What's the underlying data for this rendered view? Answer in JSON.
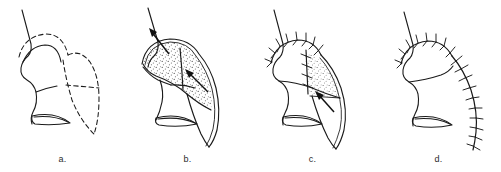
{
  "figure": {
    "background_color": "#ffffff",
    "ink_color": "#1a1a1a",
    "stipple_color": "#555555",
    "panel_count": 4,
    "view": "lateral nasal profile"
  },
  "panels": [
    {
      "id": "a",
      "label": "a.",
      "caption": "Flap design outlined with dashed incision lines on the nasal dorsum and sidewall",
      "stage": "design",
      "has_dashed_outline": true,
      "has_stipple": false,
      "has_arrows": false,
      "has_sutures": false,
      "arrow_count": 0,
      "suture_count": 0
    },
    {
      "id": "b",
      "label": "b.",
      "caption": "Flap elevated and rotated; stippled undersurface exposed with transposition arrows",
      "stage": "elevation",
      "has_dashed_outline": false,
      "has_stipple": true,
      "has_arrows": true,
      "has_sutures": false,
      "arrow_count": 2,
      "suture_count": 0
    },
    {
      "id": "c",
      "label": "c.",
      "caption": "Proximal closure sutured along the dorsum; distal flap still inset with advancement arrow",
      "stage": "inset",
      "has_dashed_outline": false,
      "has_stipple": true,
      "has_arrows": true,
      "has_sutures": true,
      "arrow_count": 1,
      "suture_count": 9
    },
    {
      "id": "d",
      "label": "d.",
      "caption": "Completed closure with continuous suture line along dorsum and lateral cheek",
      "stage": "closure",
      "has_dashed_outline": false,
      "has_stipple": false,
      "has_arrows": false,
      "has_sutures": true,
      "arrow_count": 0,
      "suture_count": 26
    }
  ],
  "legend": {
    "dashed_line_meaning": "planned incision",
    "stipple_meaning": "flap undersurface / raw surface",
    "arrow_meaning": "direction of flap movement",
    "tick_meaning": "suture"
  }
}
